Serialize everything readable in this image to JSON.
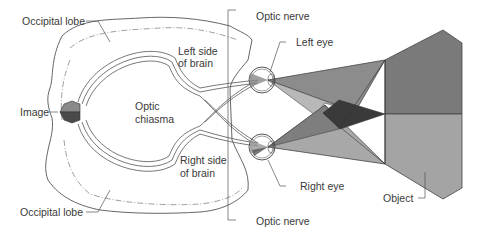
{
  "labels": {
    "occipital_lobe_top": "Occipital lobe",
    "left_side_line1": "Left side",
    "left_side_line2": "of brain",
    "optic_nerve_top": "Optic nerve",
    "left_eye": "Left eye",
    "image": "Image",
    "optic_chiasma_line1": "Optic",
    "optic_chiasma_line2": "chiasma",
    "right_side_line1": "Right side",
    "right_side_line2": "of brain",
    "right_eye": "Right eye",
    "occipital_lobe_bottom": "Occipital lobe",
    "optic_nerve_bottom": "Optic nerve",
    "object": "Object"
  },
  "colors": {
    "outline": "#555555",
    "object_top": "#7a7a7a",
    "object_bottom": "#a4a4a4",
    "overlap_dark": "#3a3a3a",
    "cone_mid": "#8c8c8c",
    "cone_light": "#b8b8b8"
  }
}
